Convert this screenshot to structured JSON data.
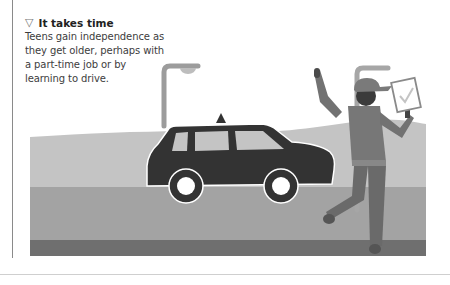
{
  "caption": {
    "marker": "▽",
    "title": "It takes time",
    "body": "Teens gain independence as they get older, perhaps with a part-time job or by learning to drive."
  },
  "illustration": {
    "subject": "teen-driving-test",
    "elements": [
      "street-lamp",
      "car",
      "examiner-with-clipboard",
      "hills",
      "road"
    ],
    "colors": {
      "sky": "#ffffff",
      "hills": "#c4c4c4",
      "ground": "#a3a3a3",
      "road_edge": "#6f6f6f",
      "car": "#333333",
      "person": "#727272",
      "lamp": "#9c9c9c"
    }
  }
}
